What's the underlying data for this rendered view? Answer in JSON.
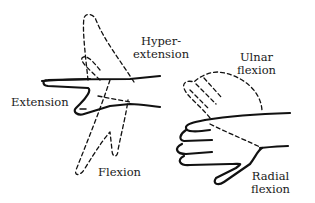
{
  "diagram": {
    "left_figure": {
      "labels": {
        "hyperextension": "Hyper-\nextension",
        "extension": "Extension",
        "flexion": "Flexion"
      }
    },
    "right_figure": {
      "labels": {
        "ulnar_flexion": "Ulnar\nflexion",
        "radial_flexion": "Radial\nflexion"
      }
    },
    "colors": {
      "ink": "#111111",
      "background": "#ffffff"
    }
  }
}
